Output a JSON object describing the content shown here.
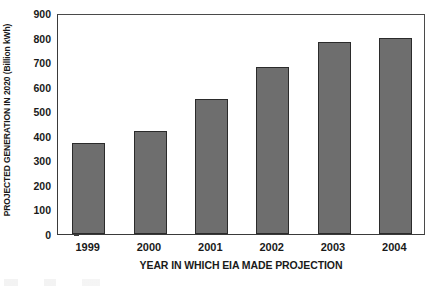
{
  "chart_data": {
    "type": "bar",
    "title": "",
    "xlabel": "YEAR IN WHICH EIA MADE PROJECTION",
    "ylabel": "PROJECTED GENERATION IN 2020 (Billion kWh)",
    "categories": [
      "1999",
      "2000",
      "2001",
      "2002",
      "2003",
      "2004"
    ],
    "values": [
      370,
      420,
      550,
      680,
      782,
      798
    ],
    "ylim": [
      0,
      900
    ],
    "ytick_values": [
      0,
      100,
      200,
      300,
      400,
      500,
      600,
      700,
      800,
      900
    ],
    "ytick_labels": [
      "0",
      "100",
      "200",
      "300",
      "400",
      "500",
      "600",
      "700",
      "800",
      "900"
    ],
    "grid": false,
    "legend": null,
    "legend_position": "none",
    "series": [
      {
        "name": "Projected generation in 2020",
        "values": [
          370,
          420,
          550,
          680,
          782,
          798
        ]
      }
    ],
    "colors": {
      "bar_fill": "#6e6e6e",
      "bar_border": "#2b2b2b",
      "axis": "#3a3a3a",
      "text": "#1a1a1a",
      "background": "#ffffff"
    }
  }
}
